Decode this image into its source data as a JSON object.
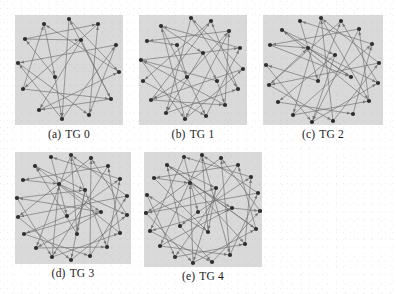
{
  "figure": {
    "type": "multi-panel-graph-figure",
    "panel_count": 5,
    "layout": "3 panels in top row, 2 panels in bottom row",
    "background_color": "#ffffff",
    "panel_background_color": "#d9d9d9",
    "node_color": "#2e2e2e",
    "edge_color": "#6e6e6e"
  },
  "panels": [
    {
      "tag": "(a)",
      "label": "TG 0",
      "caption": "(a) TG 0",
      "node_count": 14,
      "edge_count": 22,
      "width": 108,
      "height": 110
    },
    {
      "tag": "(b)",
      "label": "TG 1",
      "caption": "(b) TG 1",
      "node_count": 19,
      "edge_count": 30,
      "width": 108,
      "height": 110
    },
    {
      "tag": "(c)",
      "label": "TG 2",
      "caption": "(c) TG 2",
      "node_count": 21,
      "edge_count": 32,
      "width": 120,
      "height": 110
    },
    {
      "tag": "(d)",
      "label": "TG 3",
      "caption": "(d) TG 3",
      "node_count": 23,
      "edge_count": 36,
      "width": 116,
      "height": 112
    },
    {
      "tag": "(e)",
      "label": "TG 4",
      "caption": "(e) TG 4",
      "node_count": 25,
      "edge_count": 42,
      "width": 118,
      "height": 115
    }
  ],
  "chart_data": {
    "type": "scatter",
    "title": "",
    "xlabel": "",
    "ylabel": "",
    "series": [
      {
        "name": "TG 0",
        "node_count": 14,
        "nodes": [
          [
            54,
            4
          ],
          [
            83,
            9
          ],
          [
            101,
            30
          ],
          [
            104,
            57
          ],
          [
            96,
            84
          ],
          [
            74,
            100
          ],
          [
            47,
            104
          ],
          [
            24,
            95
          ],
          [
            8,
            74
          ],
          [
            3,
            48
          ],
          [
            10,
            24
          ],
          [
            29,
            9
          ],
          [
            66,
            25
          ],
          [
            40,
            62
          ]
        ],
        "edges": [
          [
            0,
            6
          ],
          [
            1,
            8
          ],
          [
            2,
            9
          ],
          [
            3,
            11
          ],
          [
            4,
            0
          ],
          [
            5,
            1
          ],
          [
            6,
            2
          ],
          [
            7,
            3
          ],
          [
            8,
            4
          ],
          [
            9,
            5
          ],
          [
            10,
            12
          ],
          [
            11,
            13
          ],
          [
            12,
            7
          ],
          [
            13,
            10
          ],
          [
            0,
            3
          ],
          [
            2,
            5
          ],
          [
            4,
            7
          ],
          [
            6,
            9
          ],
          [
            8,
            11
          ],
          [
            10,
            1
          ],
          [
            12,
            4
          ],
          [
            13,
            6
          ]
        ]
      },
      {
        "name": "TG 1",
        "node_count": 19,
        "nodes": [
          [
            52,
            3
          ],
          [
            72,
            6
          ],
          [
            90,
            16
          ],
          [
            101,
            33
          ],
          [
            104,
            54
          ],
          [
            99,
            74
          ],
          [
            86,
            90
          ],
          [
            67,
            101
          ],
          [
            46,
            104
          ],
          [
            27,
            98
          ],
          [
            12,
            85
          ],
          [
            4,
            66
          ],
          [
            2,
            45
          ],
          [
            8,
            26
          ],
          [
            22,
            11
          ],
          [
            38,
            30
          ],
          [
            64,
            38
          ],
          [
            48,
            62
          ],
          [
            78,
            66
          ]
        ],
        "edges": [
          [
            0,
            9
          ],
          [
            1,
            11
          ],
          [
            2,
            13
          ],
          [
            3,
            14
          ],
          [
            4,
            0
          ],
          [
            5,
            1
          ],
          [
            6,
            2
          ],
          [
            7,
            3
          ],
          [
            8,
            4
          ],
          [
            9,
            5
          ],
          [
            10,
            6
          ],
          [
            11,
            7
          ],
          [
            12,
            8
          ],
          [
            13,
            15
          ],
          [
            14,
            16
          ],
          [
            15,
            17
          ],
          [
            16,
            18
          ],
          [
            17,
            10
          ],
          [
            18,
            12
          ],
          [
            0,
            5
          ],
          [
            2,
            8
          ],
          [
            4,
            10
          ],
          [
            6,
            12
          ],
          [
            8,
            14
          ],
          [
            10,
            1
          ],
          [
            12,
            3
          ],
          [
            14,
            7
          ],
          [
            16,
            9
          ],
          [
            17,
            2
          ],
          [
            18,
            6
          ]
        ]
      },
      {
        "name": "TG 2",
        "node_count": 21,
        "nodes": [
          [
            58,
            3
          ],
          [
            78,
            6
          ],
          [
            96,
            14
          ],
          [
            109,
            29
          ],
          [
            116,
            48
          ],
          [
            115,
            68
          ],
          [
            106,
            86
          ],
          [
            90,
            99
          ],
          [
            70,
            106
          ],
          [
            49,
            107
          ],
          [
            30,
            100
          ],
          [
            15,
            87
          ],
          [
            6,
            70
          ],
          [
            3,
            50
          ],
          [
            7,
            30
          ],
          [
            19,
            15
          ],
          [
            37,
            6
          ],
          [
            45,
            33
          ],
          [
            72,
            40
          ],
          [
            55,
            66
          ],
          [
            88,
            62
          ]
        ],
        "edges": [
          [
            0,
            10
          ],
          [
            1,
            12
          ],
          [
            2,
            14
          ],
          [
            3,
            16
          ],
          [
            4,
            0
          ],
          [
            5,
            1
          ],
          [
            6,
            2
          ],
          [
            7,
            3
          ],
          [
            8,
            4
          ],
          [
            9,
            5
          ],
          [
            10,
            6
          ],
          [
            11,
            7
          ],
          [
            12,
            8
          ],
          [
            13,
            9
          ],
          [
            14,
            17
          ],
          [
            15,
            18
          ],
          [
            16,
            19
          ],
          [
            17,
            20
          ],
          [
            18,
            11
          ],
          [
            19,
            13
          ],
          [
            20,
            15
          ],
          [
            0,
            6
          ],
          [
            2,
            9
          ],
          [
            4,
            12
          ],
          [
            6,
            15
          ],
          [
            8,
            0
          ],
          [
            10,
            3
          ],
          [
            12,
            17
          ],
          [
            14,
            20
          ],
          [
            17,
            5
          ],
          [
            18,
            9
          ],
          [
            19,
            1
          ]
        ]
      },
      {
        "name": "TG 3",
        "node_count": 23,
        "nodes": [
          [
            56,
            3
          ],
          [
            76,
            6
          ],
          [
            93,
            14
          ],
          [
            105,
            27
          ],
          [
            112,
            44
          ],
          [
            112,
            63
          ],
          [
            105,
            81
          ],
          [
            92,
            95
          ],
          [
            75,
            104
          ],
          [
            56,
            108
          ],
          [
            37,
            105
          ],
          [
            21,
            96
          ],
          [
            9,
            82
          ],
          [
            3,
            65
          ],
          [
            2,
            46
          ],
          [
            8,
            28
          ],
          [
            20,
            14
          ],
          [
            36,
            5
          ],
          [
            44,
            32
          ],
          [
            70,
            38
          ],
          [
            52,
            64
          ],
          [
            86,
            60
          ],
          [
            62,
            82
          ]
        ],
        "edges": [
          [
            0,
            11
          ],
          [
            1,
            13
          ],
          [
            2,
            15
          ],
          [
            3,
            17
          ],
          [
            4,
            0
          ],
          [
            5,
            1
          ],
          [
            6,
            2
          ],
          [
            7,
            3
          ],
          [
            8,
            4
          ],
          [
            9,
            5
          ],
          [
            10,
            6
          ],
          [
            11,
            7
          ],
          [
            12,
            8
          ],
          [
            13,
            9
          ],
          [
            14,
            10
          ],
          [
            15,
            18
          ],
          [
            16,
            19
          ],
          [
            17,
            20
          ],
          [
            18,
            21
          ],
          [
            19,
            22
          ],
          [
            20,
            12
          ],
          [
            21,
            14
          ],
          [
            22,
            16
          ],
          [
            0,
            7
          ],
          [
            2,
            10
          ],
          [
            4,
            13
          ],
          [
            6,
            16
          ],
          [
            8,
            1
          ],
          [
            10,
            18
          ],
          [
            12,
            21
          ],
          [
            14,
            19
          ],
          [
            18,
            5
          ],
          [
            19,
            9
          ],
          [
            20,
            3
          ],
          [
            21,
            11
          ],
          [
            22,
            0
          ]
        ]
      },
      {
        "name": "TG 4",
        "node_count": 25,
        "nodes": [
          [
            58,
            3
          ],
          [
            77,
            6
          ],
          [
            94,
            13
          ],
          [
            107,
            25
          ],
          [
            114,
            41
          ],
          [
            116,
            59
          ],
          [
            112,
            77
          ],
          [
            101,
            92
          ],
          [
            86,
            103
          ],
          [
            68,
            110
          ],
          [
            49,
            111
          ],
          [
            31,
            105
          ],
          [
            16,
            94
          ],
          [
            6,
            79
          ],
          [
            2,
            61
          ],
          [
            3,
            43
          ],
          [
            10,
            26
          ],
          [
            23,
            13
          ],
          [
            40,
            5
          ],
          [
            46,
            31
          ],
          [
            72,
            36
          ],
          [
            54,
            60
          ],
          [
            88,
            56
          ],
          [
            64,
            80
          ],
          [
            36,
            74
          ]
        ],
        "edges": [
          [
            0,
            12
          ],
          [
            1,
            14
          ],
          [
            2,
            16
          ],
          [
            3,
            18
          ],
          [
            4,
            0
          ],
          [
            5,
            1
          ],
          [
            6,
            2
          ],
          [
            7,
            3
          ],
          [
            8,
            4
          ],
          [
            9,
            5
          ],
          [
            10,
            6
          ],
          [
            11,
            7
          ],
          [
            12,
            8
          ],
          [
            13,
            9
          ],
          [
            14,
            10
          ],
          [
            15,
            11
          ],
          [
            16,
            19
          ],
          [
            17,
            20
          ],
          [
            18,
            21
          ],
          [
            19,
            22
          ],
          [
            20,
            23
          ],
          [
            21,
            24
          ],
          [
            22,
            13
          ],
          [
            23,
            15
          ],
          [
            24,
            17
          ],
          [
            0,
            8
          ],
          [
            2,
            11
          ],
          [
            4,
            14
          ],
          [
            6,
            17
          ],
          [
            8,
            1
          ],
          [
            10,
            19
          ],
          [
            12,
            22
          ],
          [
            14,
            20
          ],
          [
            16,
            23
          ],
          [
            19,
            7
          ],
          [
            20,
            10
          ],
          [
            21,
            3
          ],
          [
            22,
            5
          ],
          [
            23,
            0
          ],
          [
            24,
            9
          ],
          [
            18,
            13
          ],
          [
            17,
            6
          ]
        ]
      }
    ]
  }
}
